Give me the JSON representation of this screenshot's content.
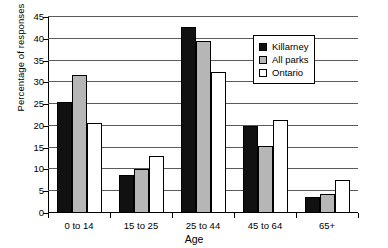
{
  "chart_data": {
    "type": "bar",
    "title": "",
    "subtitle": "",
    "xlabel": "Age",
    "ylabel": "Percentage of responses",
    "categories": [
      "0 to 14",
      "15 to 25",
      "25 to 44",
      "45 to 64",
      "65+"
    ],
    "series": [
      {
        "name": "Killarney",
        "color": "#111111",
        "values": [
          25.4,
          8.8,
          42.8,
          20.0,
          3.6
        ]
      },
      {
        "name": "All parks",
        "color": "#b6b6b6",
        "values": [
          31.8,
          10.0,
          39.5,
          15.4,
          4.3
        ]
      },
      {
        "name": "Ontario",
        "color": "#ffffff",
        "values": [
          20.6,
          13.0,
          32.4,
          21.3,
          7.5
        ]
      }
    ],
    "ylim": [
      0,
      45
    ],
    "yticks": [
      0,
      5,
      10,
      15,
      20,
      25,
      30,
      35,
      40,
      45
    ],
    "ytick_labels": [
      "0",
      "5",
      "10",
      "15",
      "20",
      "25",
      "30",
      "35",
      "40",
      "45"
    ],
    "grid": true,
    "legend_position": "top-right"
  }
}
